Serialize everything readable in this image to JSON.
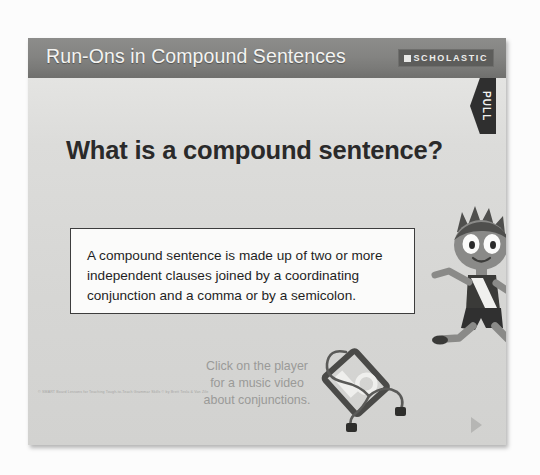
{
  "slide": {
    "header": {
      "title": "Run-Ons in Compound Sentences",
      "logo_wordmark": "SCHOLASTIC"
    },
    "heading": "What is a compound sentence?",
    "pull_tab": {
      "label": "PULL"
    },
    "definition": {
      "text": "A compound sentence is made up of two or more independent clauses joined by a coordinating conjunction and a comma or by a semicolon."
    },
    "player_prompt": {
      "line1": "Click on the player",
      "line2": "for a music video",
      "line3": "about conjunctions."
    },
    "footer_credit": "© SMART Board Lessons for Teaching Tough-to-Teach Grammar Skills © by Brett Tesla & Van Zile",
    "colors": {
      "header_bar": "#7f7f7d",
      "slide_background": "#d8d8d6",
      "card_background": "#fbfbfa",
      "heading_text": "#2a2a2a",
      "prompt_text": "#9a9a98",
      "pull_tab": "#2f2f2f"
    },
    "icons": {
      "scholastic_mark": "square-mark-icon",
      "pull_tab": "pull-tab-arrow-icon",
      "music_player": "mp3-player-icon",
      "headphones": "headphones-icon",
      "character": "running-boy-icon",
      "next": "next-arrow-icon"
    }
  }
}
